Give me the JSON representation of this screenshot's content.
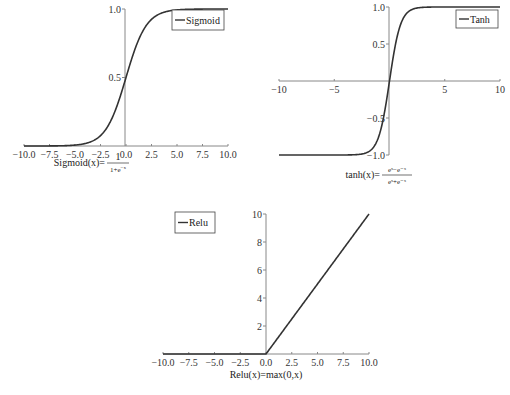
{
  "chart_data": [
    {
      "type": "line",
      "title": "",
      "series": [
        {
          "name": "Sigmoid",
          "function": "1/(1+e^-x)"
        }
      ],
      "x": [
        -10.0,
        -7.5,
        -5.0,
        -2.5,
        0.0,
        2.5,
        5.0,
        7.5,
        10.0
      ],
      "values": [
        4.54e-05,
        0.000553,
        0.00669,
        0.0759,
        0.5,
        0.924,
        0.993,
        0.999,
        0.99995
      ],
      "xticks": [
        "−10.0",
        "−7.5",
        "−5.0",
        "−2.5",
        "0.0",
        "2.5",
        "5.0",
        "7.5",
        "10.0"
      ],
      "yticks": [
        "0.5",
        "1.0"
      ],
      "xlim": [
        -10,
        10
      ],
      "ylim": [
        0,
        1
      ],
      "legend": "Sigmoid",
      "legend_position": "upper right",
      "caption": {
        "lhs": "Sigmoid(x)=",
        "num": "1",
        "den": "1+e",
        "den_exp": "−x"
      }
    },
    {
      "type": "line",
      "title": "",
      "series": [
        {
          "name": "Tanh",
          "function": "(e^x-e^-x)/(e^x+e^-x)"
        }
      ],
      "x": [
        -10,
        -5,
        -2,
        -1,
        0,
        1,
        2,
        5,
        10
      ],
      "values": [
        -1.0,
        -0.9999,
        -0.964,
        -0.762,
        0.0,
        0.762,
        0.964,
        0.9999,
        1.0
      ],
      "xticks": [
        "−10",
        "−5",
        "5",
        "10"
      ],
      "yticks": [
        "−1.0",
        "−0.5",
        "0.5",
        "1.0"
      ],
      "xlim": [
        -10,
        10
      ],
      "ylim": [
        -1,
        1
      ],
      "legend": "Tanh",
      "legend_position": "upper right",
      "caption": {
        "lhs": "tanh(x)=",
        "num": "eˣ−e⁻ˣ",
        "den": "eˣ+e⁻ˣ"
      }
    },
    {
      "type": "line",
      "title": "",
      "series": [
        {
          "name": "Relu",
          "function": "max(0,x)"
        }
      ],
      "x": [
        -10.0,
        -7.5,
        -5.0,
        -2.5,
        0.0,
        2.5,
        5.0,
        7.5,
        10.0
      ],
      "values": [
        0,
        0,
        0,
        0,
        0,
        2.5,
        5.0,
        7.5,
        10.0
      ],
      "xticks": [
        "−10.0",
        "−7.5",
        "−5.0",
        "−2.5",
        "0.0",
        "2.5",
        "5.0",
        "7.5",
        "10.0"
      ],
      "yticks": [
        "2",
        "4",
        "6",
        "8",
        "10"
      ],
      "xlim": [
        -10,
        10
      ],
      "ylim": [
        0,
        10
      ],
      "legend": "Relu",
      "legend_position": "upper left",
      "caption": {
        "text": "Relu(x)=max(0,x)"
      }
    }
  ],
  "colors": {
    "line": "#333333",
    "axis": "#888888",
    "text": "#333333"
  }
}
